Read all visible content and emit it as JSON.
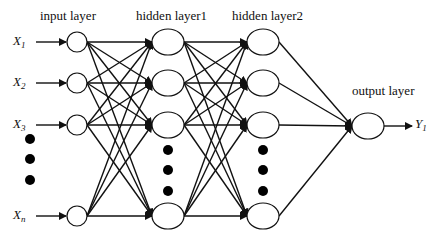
{
  "diagram": {
    "type": "feed-forward neural network",
    "layers": [
      {
        "name": "input layer",
        "label": "input layer",
        "nodes": [
          "X1",
          "X2",
          "X3",
          "...",
          "Xn"
        ]
      },
      {
        "name": "hidden layer1",
        "label": "hidden layer1",
        "nodes": [
          "h1_1",
          "h1_2",
          "h1_3",
          "...",
          "h1_m"
        ]
      },
      {
        "name": "hidden layer2",
        "label": "hidden layer2",
        "nodes": [
          "h2_1",
          "h2_2",
          "h2_3",
          "...",
          "h2_k"
        ]
      },
      {
        "name": "output layer",
        "label": "output layer",
        "nodes": [
          "Y1"
        ]
      }
    ],
    "inputs": [
      {
        "base": "X",
        "sub": "1"
      },
      {
        "base": "X",
        "sub": "2"
      },
      {
        "base": "X",
        "sub": "3"
      },
      {
        "base": "X",
        "sub": "n"
      }
    ],
    "output": {
      "base": "Y",
      "sub": "1"
    },
    "connections": "fully connected between consecutive layers"
  },
  "labels": {
    "input_layer": "input layer",
    "hidden_layer1": "hidden layer1",
    "hidden_layer2": "hidden layer2",
    "output_layer": "output layer"
  }
}
